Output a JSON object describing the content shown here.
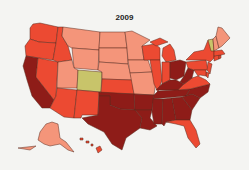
{
  "map": {
    "title": "2009",
    "type": "choropleth",
    "region": "United States",
    "categories": [
      {
        "id": "c1",
        "color": "#c8c46a"
      },
      {
        "id": "c2",
        "color": "#f4957a"
      },
      {
        "id": "c3",
        "color": "#ec4a32"
      },
      {
        "id": "c4",
        "color": "#8e1c18"
      }
    ],
    "states": {
      "WA": "c3",
      "OR": "c3",
      "CA": "c4",
      "NV": "c3",
      "ID": "c3",
      "MT": "c2",
      "WY": "c2",
      "UT": "c2",
      "CO": "c1",
      "AZ": "c3",
      "NM": "c3",
      "ND": "c2",
      "SD": "c2",
      "NE": "c2",
      "KS": "c3",
      "OK": "c4",
      "TX": "c4",
      "MN": "c2",
      "IA": "c2",
      "MO": "c2",
      "AR": "c4",
      "LA": "c4",
      "WI": "c3",
      "IL": "c3",
      "MI": "c3",
      "IN": "c3",
      "OH": "c4",
      "KY": "c4",
      "TN": "c4",
      "MS": "c4",
      "AL": "c4",
      "GA": "c4",
      "FL": "c3",
      "SC": "c4",
      "NC": "c4",
      "VA": "c3",
      "WV": "c4",
      "PA": "c3",
      "NY": "c3",
      "VT": "c1",
      "NH": "c2",
      "ME": "c2",
      "MA": "c3",
      "CT": "c3",
      "RI": "c3",
      "NJ": "c3",
      "DE": "c3",
      "MD": "c3",
      "AK": "c2",
      "HI": "c3"
    }
  }
}
